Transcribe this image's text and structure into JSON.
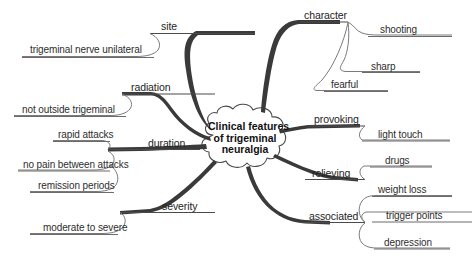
{
  "diagram": {
    "type": "mind-map",
    "title": "Clinical features of trigeminal neuralgia",
    "center": {
      "label": "Clinical features of trigeminal neuralgia",
      "line1": "Clinical features",
      "line2": "of trigeminal",
      "line3": "neuralgia"
    },
    "colors": {
      "background": "#ffffff",
      "branch": "#3a3a3a",
      "subbranch": "#6b6b6b",
      "text": "#2b2b2b",
      "center_text": "#111111"
    },
    "branches": [
      {
        "label": "site",
        "side": "left",
        "children": [
          {
            "label": "trigeminal nerve unilateral"
          }
        ]
      },
      {
        "label": "radiation",
        "side": "left",
        "children": [
          {
            "label": "not outside trigeminal"
          }
        ]
      },
      {
        "label": "duration",
        "side": "left",
        "children": [
          {
            "label": "rapid attacks"
          },
          {
            "label": "no pain between attacks"
          },
          {
            "label": "remission periods"
          }
        ]
      },
      {
        "label": "severity",
        "side": "left",
        "children": [
          {
            "label": "moderate to severe"
          }
        ]
      },
      {
        "label": "character",
        "side": "right",
        "children": [
          {
            "label": "shooting"
          },
          {
            "label": "sharp"
          },
          {
            "label": "fearful"
          }
        ]
      },
      {
        "label": "provoking",
        "side": "right",
        "children": [
          {
            "label": "light touch"
          }
        ]
      },
      {
        "label": "relieving",
        "side": "right",
        "children": [
          {
            "label": "drugs"
          }
        ]
      },
      {
        "label": "associated",
        "side": "right",
        "children": [
          {
            "label": "weight loss"
          },
          {
            "label": "trigger points"
          },
          {
            "label": "depression"
          }
        ]
      }
    ]
  }
}
